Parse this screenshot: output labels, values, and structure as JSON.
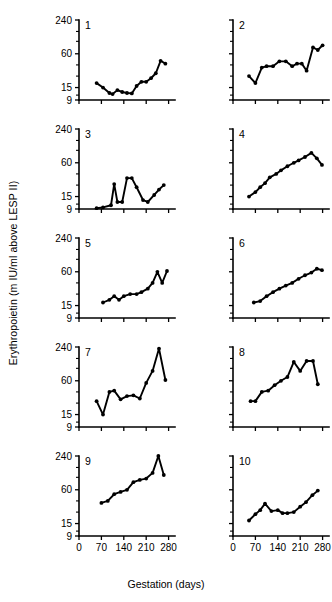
{
  "figure": {
    "ylabel": "Erythropoietin (m IU/ml above LESP II)",
    "xlabel": "Gestation (days)"
  },
  "chart_data": {
    "type": "line",
    "title": "",
    "subtitle": "",
    "xlabel": "Gestation (days)",
    "ylabel": "Erythropoietin (m IU/ml above LESP II)",
    "yscale": "log",
    "ylim": [
      9,
      240
    ],
    "ytick_labels": [
      "240",
      "60",
      "15",
      "9"
    ],
    "ytick_values": [
      240,
      60,
      15,
      9
    ],
    "xlim": [
      0,
      300
    ],
    "xtick_labels": [
      "0",
      "70",
      "140",
      "210",
      "280"
    ],
    "xtick_values": [
      0,
      70,
      140,
      210,
      280
    ],
    "grid": false,
    "legend": "none",
    "layout": "small-multiples 5 rows x 2 columns",
    "marker": "filled-circle",
    "panels": [
      {
        "id": "1",
        "x": [
          55,
          75,
          95,
          105,
          120,
          135,
          150,
          165,
          180,
          195,
          210,
          225,
          240,
          255,
          270
        ],
        "y": [
          18,
          15,
          12,
          11.5,
          13.5,
          12.5,
          12,
          11.8,
          16,
          19,
          19,
          22,
          27,
          45,
          40
        ]
      },
      {
        "id": "2",
        "x": [
          50,
          70,
          90,
          105,
          125,
          145,
          165,
          185,
          200,
          215,
          230,
          250,
          265,
          280
        ],
        "y": [
          24,
          18,
          34,
          36,
          36,
          44,
          44,
          36,
          40,
          40,
          30,
          78,
          70,
          85
        ]
      },
      {
        "id": "3",
        "x": [
          55,
          75,
          100,
          110,
          120,
          135,
          150,
          165,
          180,
          200,
          215,
          235,
          250,
          265
        ],
        "y": [
          9.3,
          9.6,
          10.5,
          25,
          12,
          12,
          32,
          32,
          22,
          13,
          12,
          16,
          20,
          24
        ]
      },
      {
        "id": "4",
        "x": [
          50,
          70,
          85,
          100,
          115,
          135,
          150,
          170,
          190,
          205,
          225,
          245,
          262,
          278
        ],
        "y": [
          15,
          18,
          22,
          26,
          33,
          38,
          44,
          52,
          60,
          66,
          76,
          90,
          72,
          55
        ]
      },
      {
        "id": "5",
        "x": [
          75,
          95,
          110,
          125,
          140,
          160,
          180,
          195,
          215,
          230,
          245,
          260,
          275
        ],
        "y": [
          17,
          19,
          22,
          19,
          22,
          24,
          24,
          26,
          30,
          38,
          60,
          38,
          62
        ]
      },
      {
        "id": "6",
        "x": [
          65,
          85,
          105,
          125,
          145,
          165,
          185,
          205,
          225,
          245,
          262,
          278
        ],
        "y": [
          17,
          18,
          22,
          26,
          30,
          34,
          38,
          45,
          52,
          58,
          68,
          64
        ]
      },
      {
        "id": "7",
        "x": [
          55,
          75,
          95,
          110,
          130,
          150,
          170,
          190,
          210,
          230,
          250,
          270
        ],
        "y": [
          26,
          15,
          38,
          40,
          28,
          32,
          33,
          29,
          55,
          90,
          225,
          62
        ]
      },
      {
        "id": "8",
        "x": [
          55,
          70,
          90,
          110,
          130,
          150,
          170,
          190,
          210,
          230,
          250,
          265
        ],
        "y": [
          26,
          26,
          38,
          40,
          50,
          60,
          70,
          130,
          90,
          135,
          135,
          52
        ]
      },
      {
        "id": "9",
        "x": [
          70,
          90,
          110,
          130,
          150,
          170,
          190,
          210,
          230,
          248,
          265
        ],
        "y": [
          35,
          38,
          50,
          55,
          60,
          82,
          90,
          95,
          120,
          240,
          110
        ]
      },
      {
        "id": "10",
        "x": [
          50,
          70,
          85,
          100,
          120,
          140,
          155,
          170,
          190,
          210,
          228,
          248,
          265
        ],
        "y": [
          17,
          22,
          26,
          34,
          25,
          26,
          23,
          23,
          24,
          30,
          36,
          48,
          58
        ]
      }
    ]
  }
}
